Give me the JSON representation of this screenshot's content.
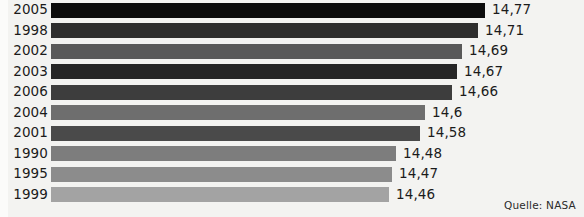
{
  "chart_data": {
    "type": "bar",
    "orientation": "horizontal",
    "title": "",
    "xlabel": "",
    "ylabel": "",
    "categories": [
      "2005",
      "1998",
      "2002",
      "2003",
      "2006",
      "2004",
      "2001",
      "1990",
      "1995",
      "1999"
    ],
    "values": [
      14.77,
      14.71,
      14.69,
      14.67,
      14.66,
      14.6,
      14.58,
      14.48,
      14.47,
      14.46
    ],
    "value_labels": [
      "14,77",
      "14,71",
      "14,69",
      "14,67",
      "14,66",
      "14,6",
      "14,58",
      "14,48",
      "14,47",
      "14,46"
    ],
    "bar_colors": [
      "#0c0c0c",
      "#2e2e2e",
      "#595959",
      "#262626",
      "#3d3d3d",
      "#6e6e6e",
      "#4a4a4a",
      "#7d7d7d",
      "#8c8c8c",
      "#a3a3a3"
    ],
    "xlim": [
      14.44,
      14.79
    ],
    "grid": false,
    "legend": false,
    "source": "Quelle: NASA",
    "background_color": "#f3f3f1",
    "text_color": "#1b1b1b"
  },
  "rows": [
    {
      "year": "2005",
      "value_label": "14,77",
      "value": 14.77,
      "bar_width": 434,
      "color": "#0c0c0c"
    },
    {
      "year": "1998",
      "value_label": "14,71",
      "value": 14.71,
      "bar_width": 427,
      "color": "#2e2e2e"
    },
    {
      "year": "2002",
      "value_label": "14,69",
      "value": 14.69,
      "bar_width": 411,
      "color": "#595959"
    },
    {
      "year": "2003",
      "value_label": "14,67",
      "value": 14.67,
      "bar_width": 406,
      "color": "#262626"
    },
    {
      "year": "2006",
      "value_label": "14,66",
      "value": 14.66,
      "bar_width": 401,
      "color": "#3d3d3d"
    },
    {
      "year": "2004",
      "value_label": "14,6",
      "value": 14.6,
      "bar_width": 374,
      "color": "#6e6e6e"
    },
    {
      "year": "2001",
      "value_label": "14,58",
      "value": 14.58,
      "bar_width": 369,
      "color": "#4a4a4a"
    },
    {
      "year": "1990",
      "value_label": "14,48",
      "value": 14.48,
      "bar_width": 345,
      "color": "#7d7d7d"
    },
    {
      "year": "1995",
      "value_label": "14,47",
      "value": 14.47,
      "bar_width": 341,
      "color": "#8c8c8c"
    },
    {
      "year": "1999",
      "value_label": "14,46",
      "value": 14.46,
      "bar_width": 338,
      "color": "#a3a3a3"
    }
  ],
  "source": {
    "label": "Quelle: NASA"
  }
}
